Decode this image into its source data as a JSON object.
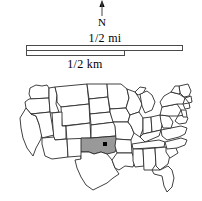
{
  "legend": {
    "north": {
      "label": "N",
      "icon": "north-arrow-icon"
    },
    "scale": {
      "miles_label": "1/2 mi",
      "kilometers_label": "1/2 km",
      "miles_bar_length_px": 157,
      "km_bar_length_px": 99
    }
  },
  "locator_map": {
    "title": "United States locator map",
    "highlighted_region": "Oklahoma",
    "highlight_color": "#999999",
    "outline_color": "#2b2b2b",
    "background_color": "#ffffff",
    "marker": {
      "name": "location-dot",
      "color": "#000000",
      "x": 96,
      "y": 56
    }
  }
}
